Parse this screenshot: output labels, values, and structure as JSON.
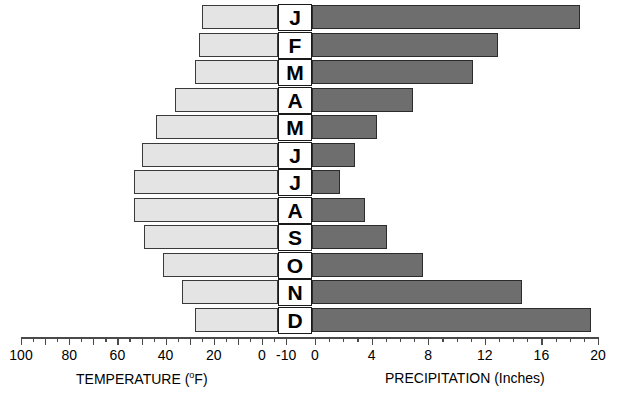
{
  "chart_data": {
    "type": "bar",
    "title": "",
    "orientation": "horizontal-bidirectional",
    "categories": [
      "J",
      "F",
      "M",
      "A",
      "M",
      "J",
      "J",
      "A",
      "S",
      "O",
      "N",
      "D"
    ],
    "month_labels": [
      "J",
      "F",
      "M",
      "A",
      "M",
      "J",
      "J",
      "A",
      "S",
      "O",
      "N",
      "D"
    ],
    "series": [
      {
        "name": "Temperature",
        "axis": "left",
        "unit": "°F",
        "direction": "right-to-left",
        "values": [
          25,
          26,
          28,
          36,
          44,
          50,
          53,
          53,
          49,
          41,
          33,
          28
        ]
      },
      {
        "name": "Precipitation",
        "axis": "right",
        "unit": "Inches",
        "direction": "left-to-right",
        "values": [
          18.7,
          12.9,
          11.2,
          6.9,
          4.4,
          2.8,
          1.8,
          3.5,
          5.1,
          7.6,
          14.6,
          19.5
        ]
      }
    ],
    "left_axis": {
      "label": "TEMPERATURE",
      "unit": "(°F)",
      "ticks": [
        100,
        80,
        60,
        40,
        20,
        0,
        -10
      ],
      "tick_labels": [
        "100",
        "80",
        "60",
        "40",
        "20",
        "0",
        "-10"
      ],
      "minor_tick_step": 10,
      "range": [
        -10,
        100
      ],
      "reversed": true
    },
    "right_axis": {
      "label": "PRECIPITATION",
      "unit": "(Inches)",
      "ticks": [
        0,
        4,
        8,
        12,
        16,
        20
      ],
      "tick_labels": [
        "0",
        "4",
        "8",
        "12",
        "16",
        "20"
      ],
      "minor_tick_step": 1,
      "range": [
        0,
        20
      ]
    },
    "grid": false,
    "legend": "none",
    "colors": {
      "temperature_fill": "#e4e4e4",
      "temperature_stroke": "#3a3a3a",
      "precipitation_fill": "#6e6e6e",
      "precipitation_stroke": "#2b2b2b",
      "axis": "#4a4a4a",
      "text": "#000000",
      "background": "#ffffff"
    }
  },
  "axis_titles": {
    "left_main": "TEMPERATURE",
    "left_unit_pre": "(",
    "left_unit_o": "o",
    "left_unit_post": "F)",
    "right": "PRECIPITATION (Inches)"
  }
}
